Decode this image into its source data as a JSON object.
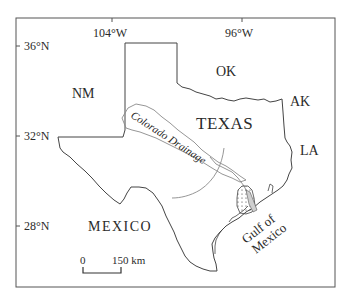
{
  "map": {
    "longitude_ticks": [
      {
        "label": "104°W",
        "x": 112
      },
      {
        "label": "96°W",
        "x": 242
      }
    ],
    "latitude_ticks": [
      {
        "label": "36°N",
        "y": 46
      },
      {
        "label": "32°N",
        "y": 136
      },
      {
        "label": "28°N",
        "y": 226
      }
    ],
    "labels": {
      "nm": "NM",
      "ok": "OK",
      "ak": "AK",
      "la": "LA",
      "texas": "TEXAS",
      "mexico": "MEXICO",
      "gulf_line1": "Gulf of",
      "gulf_line2": "Mexico",
      "drainage": "Colorado Drainage"
    },
    "scale_bar": {
      "start_label": "0",
      "end_label": "150 km"
    },
    "colors": {
      "frame": "#555555",
      "border": "#444444",
      "drainage": "#8a8a8a",
      "delta_fill": "#cfcfcf",
      "text": "#2a2a2a"
    }
  }
}
